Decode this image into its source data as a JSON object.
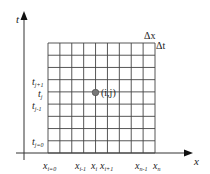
{
  "diagram": {
    "axes": {
      "x_label": "x",
      "t_label": "t"
    },
    "grid": {
      "columns": 9,
      "rows": 9,
      "line_color": "#444444"
    },
    "step_labels": {
      "dx": "Δx",
      "dt": "Δt"
    },
    "t_ticks": [
      {
        "base": "t",
        "sub": "j+1"
      },
      {
        "base": "t",
        "sub": "j"
      },
      {
        "base": "t",
        "sub": "j-1"
      },
      {
        "base": "t",
        "sub": "j=0"
      }
    ],
    "x_ticks": [
      {
        "base": "x",
        "sub": "i=0"
      },
      {
        "base": "x",
        "sub": "i-1"
      },
      {
        "base": "x",
        "sub": "i"
      },
      {
        "base": "x",
        "sub": "i+1"
      },
      {
        "base": "x",
        "sub": "n-1"
      },
      {
        "base": "x",
        "sub": "n"
      }
    ],
    "node": {
      "label": "(i,j)",
      "color": "#777777"
    }
  }
}
